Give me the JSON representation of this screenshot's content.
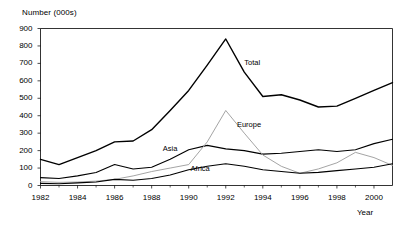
{
  "chart_data": {
    "type": "line",
    "title": "",
    "ylabel": "Number (000s)",
    "xlabel": "Year",
    "ylim": [
      0,
      900
    ],
    "xlim": [
      1982,
      2001
    ],
    "grid": false,
    "legend_position": "inline-annotations",
    "ytick_labels": [
      "0",
      "100",
      "200",
      "300",
      "400",
      "500",
      "600",
      "700",
      "800",
      "900"
    ],
    "ytick_values": [
      0,
      100,
      200,
      300,
      400,
      500,
      600,
      700,
      800,
      900
    ],
    "xtick_labels": [
      "1982",
      "1984",
      "1986",
      "1988",
      "1990",
      "1992",
      "1994",
      "1996",
      "1998",
      "2000"
    ],
    "xtick_values": [
      1982,
      1984,
      1986,
      1988,
      1990,
      1992,
      1994,
      1996,
      1998,
      2000
    ],
    "x": [
      1982,
      1983,
      1984,
      1985,
      1986,
      1987,
      1988,
      1989,
      1990,
      1991,
      1992,
      1993,
      1994,
      1995,
      1996,
      1997,
      1998,
      1999,
      2000,
      2001
    ],
    "series": [
      {
        "name": "Total",
        "color": "#000000",
        "width": 1.4,
        "label_x": 1993.0,
        "label_y": 700,
        "values": [
          150,
          120,
          160,
          200,
          250,
          255,
          320,
          430,
          545,
          690,
          840,
          650,
          510,
          520,
          490,
          450,
          455,
          500,
          545,
          590
        ]
      },
      {
        "name": "Asia",
        "color": "#000000",
        "width": 1.1,
        "label_x": 1988.6,
        "label_y": 210,
        "values": [
          45,
          40,
          55,
          75,
          120,
          95,
          105,
          150,
          205,
          230,
          210,
          200,
          180,
          185,
          195,
          205,
          195,
          205,
          240,
          265
        ]
      },
      {
        "name": "Europe",
        "color": "#9a9a9a",
        "width": 0.9,
        "label_x": 1992.6,
        "label_y": 345,
        "values": [
          22,
          18,
          20,
          25,
          35,
          55,
          80,
          100,
          120,
          250,
          430,
          300,
          175,
          110,
          70,
          95,
          130,
          190,
          160,
          115
        ]
      },
      {
        "name": "Africa",
        "color": "#000000",
        "width": 1.1,
        "label_x": 1990.1,
        "label_y": 95,
        "values": [
          12,
          10,
          15,
          20,
          35,
          30,
          40,
          60,
          90,
          110,
          125,
          110,
          90,
          80,
          70,
          75,
          85,
          95,
          105,
          125
        ]
      }
    ]
  },
  "axes": {
    "y_axis_title": "Number (000s)",
    "x_axis_title": "Year"
  }
}
